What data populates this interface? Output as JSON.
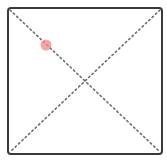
{
  "canvas": {
    "width": 167,
    "height": 166,
    "background": "#ffffff"
  },
  "frame": {
    "x": 8,
    "y": 8,
    "width": 154,
    "height": 146,
    "corner_radius": 3,
    "stroke": "#3a3a3a",
    "stroke_width": 2
  },
  "diagonals": {
    "stroke": "#6e6e6e",
    "stroke_width": 1.6,
    "dash": "1.6 3",
    "lines": [
      {
        "name": "diagonal-top-left-to-bottom-right",
        "x1": 10,
        "y1": 10,
        "x2": 160,
        "y2": 152
      },
      {
        "name": "diagonal-top-right-to-bottom-left",
        "x1": 160,
        "y1": 10,
        "x2": 10,
        "y2": 152
      }
    ]
  },
  "marker": {
    "cx": 46,
    "cy": 45,
    "r": 5.5,
    "fill": "#f08a8a",
    "opacity": 0.75
  }
}
